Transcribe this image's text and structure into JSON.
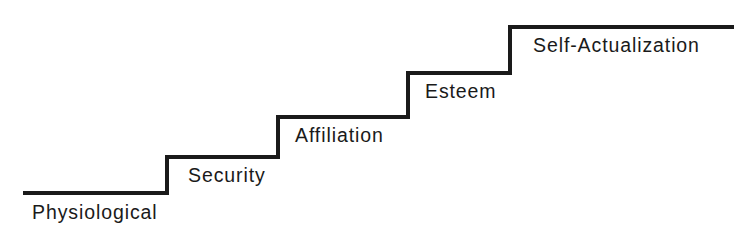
{
  "figure": {
    "name": "maslow-hierarchy-of-needs-staircase",
    "background_color": "#ffffff",
    "line_color": "#1a1a1a",
    "text_color": "#1a1a1a",
    "width": 742,
    "height": 243
  },
  "chart_data": {
    "type": "line",
    "title": "",
    "subtitle": "",
    "xlabel": "",
    "ylabel": "",
    "grid": false,
    "legend": "none",
    "categories": [
      "Physiological",
      "Security",
      "Affiliation",
      "Esteem",
      "Self-Actualization"
    ],
    "values": [
      1,
      2,
      3,
      4,
      5
    ],
    "xlim": [
      0,
      742
    ],
    "ylim": [
      0,
      243
    ],
    "steps": [
      {
        "level": 1,
        "label": "Physiological",
        "tread_x_start": 23,
        "tread_x_end": 167,
        "tread_y": 193,
        "label_x": 32,
        "label_y": 202
      },
      {
        "level": 2,
        "label": "Security",
        "tread_x_start": 167,
        "tread_x_end": 278,
        "tread_y": 157,
        "label_x": 188,
        "label_y": 165
      },
      {
        "level": 3,
        "label": "Affiliation",
        "tread_x_start": 278,
        "tread_x_end": 408,
        "tread_y": 117,
        "label_x": 295,
        "label_y": 125
      },
      {
        "level": 4,
        "label": "Esteem",
        "tread_x_start": 408,
        "tread_x_end": 510,
        "tread_y": 73,
        "label_x": 425,
        "label_y": 81
      },
      {
        "level": 5,
        "label": "Self-Actualization",
        "tread_x_start": 510,
        "tread_x_end": 734,
        "tread_y": 27,
        "label_x": 533,
        "label_y": 35
      }
    ],
    "polyline_points": "23,193 167,193 167,157 278,157 278,117 408,117 408,73 510,73 510,27 734,27",
    "stroke_width": 4
  }
}
